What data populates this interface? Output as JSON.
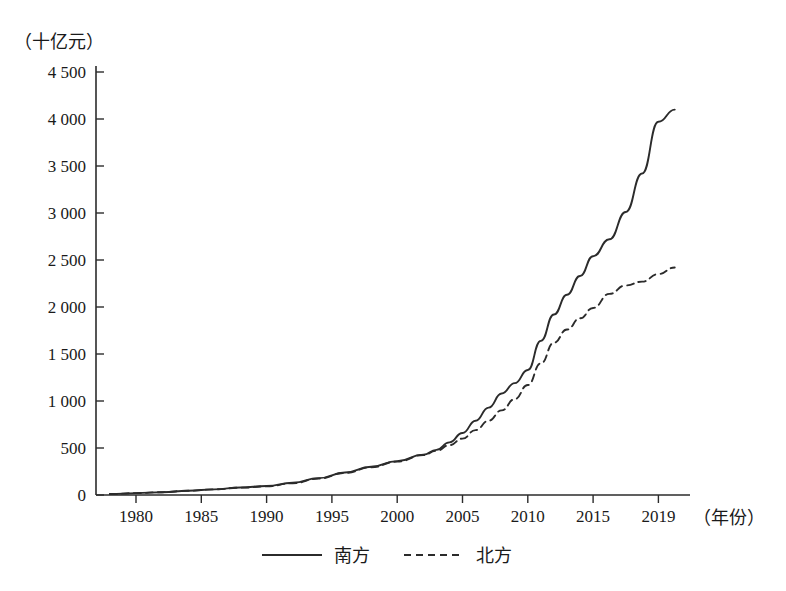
{
  "chart_data": {
    "type": "line",
    "title": "",
    "xlabel": "（年份）",
    "ylabel": "（十亿元）",
    "xlim": [
      1978,
      2020
    ],
    "ylim": [
      0,
      4500
    ],
    "grid": false,
    "legend_position": "bottom",
    "y_ticks": [
      "0",
      "500",
      "1 000",
      "1 500",
      "2 000",
      "2 500",
      "3 000",
      "3 500",
      "4 000",
      "4 500"
    ],
    "y_tick_values": [
      0,
      500,
      1000,
      1500,
      2000,
      2500,
      3000,
      3500,
      4000,
      4500
    ],
    "x_ticks": [
      "1980",
      "1985",
      "1990",
      "1995",
      "2000",
      "2005",
      "2010",
      "2015",
      "2019"
    ],
    "x_tick_values": [
      1980,
      1985,
      1990,
      1995,
      2000,
      2005,
      2010,
      2015,
      2019
    ],
    "x": [
      1978,
      1980,
      1982,
      1984,
      1986,
      1988,
      1990,
      1992,
      1994,
      1996,
      1998,
      2000,
      2002,
      2003,
      2004,
      2005,
      2006,
      2007,
      2008,
      2009,
      2010,
      2011,
      2012,
      2013,
      2014,
      2015,
      2016,
      2017,
      2018,
      2019,
      2020
    ],
    "series": [
      {
        "name": "南方",
        "style": "solid",
        "color": "#2b2b2b",
        "values": [
          10,
          20,
          30,
          45,
          60,
          80,
          95,
          130,
          180,
          240,
          300,
          360,
          430,
          480,
          560,
          660,
          790,
          930,
          1080,
          1190,
          1330,
          1640,
          1920,
          2130,
          2330,
          2540,
          2720,
          3010,
          3420,
          3970,
          4100
        ]
      },
      {
        "name": "北方",
        "style": "dashed",
        "color": "#2b2b2b",
        "values": [
          10,
          20,
          30,
          45,
          60,
          78,
          92,
          125,
          175,
          235,
          295,
          355,
          425,
          470,
          530,
          600,
          690,
          790,
          900,
          1020,
          1170,
          1400,
          1620,
          1760,
          1880,
          1990,
          2140,
          2230,
          2270,
          2350,
          2420
        ]
      }
    ]
  },
  "legend": {
    "items": [
      {
        "label": "南方",
        "style": "solid"
      },
      {
        "label": "北方",
        "style": "dashed"
      }
    ]
  }
}
